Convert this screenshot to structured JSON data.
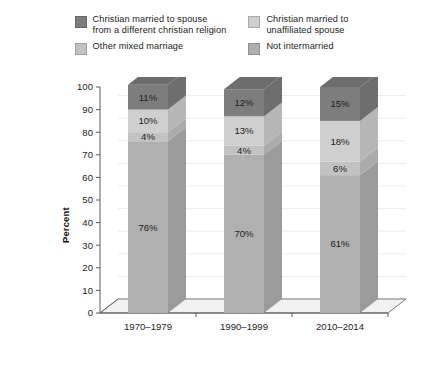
{
  "legend": {
    "items": [
      {
        "label": "Christian married to spouse\nfrom a different christian religion",
        "color": "#7d7d7d",
        "key": "diff_christian"
      },
      {
        "label": "Christian married to\nunaffiliated spouse",
        "color": "#cfcfcf",
        "key": "unaffiliated"
      },
      {
        "label": "Other mixed marriage",
        "color": "#c2c2c2",
        "key": "other_mixed"
      },
      {
        "label": "Not intermarried",
        "color": "#b0b0b0",
        "key": "not_intermarried"
      }
    ]
  },
  "axes": {
    "ylabel": "Percent",
    "yticks": [
      "100",
      "90",
      "80",
      "70",
      "60",
      "50",
      "40",
      "30",
      "20",
      "10",
      "0"
    ],
    "xticks": [
      "1970–1979",
      "1990–1999",
      "2010–2014"
    ]
  },
  "chart_data": {
    "type": "bar",
    "subtype": "stacked-column-3d",
    "title": "",
    "xlabel": "",
    "ylabel": "Percent",
    "ylim": [
      0,
      100
    ],
    "ytick_step": 10,
    "grid": true,
    "legend_position": "top",
    "categories": [
      "1970–1979",
      "1990–1999",
      "2010–2014"
    ],
    "stack_order_bottom_to_top": [
      "Not intermarried",
      "Other mixed marriage",
      "Christian married to unaffiliated spouse",
      "Christian married to spouse from a different christian religion"
    ],
    "series": [
      {
        "name": "Not intermarried",
        "color": "#b0b0b0",
        "values": [
          76,
          70,
          61
        ],
        "labels": [
          "76%",
          "70%",
          "61%"
        ]
      },
      {
        "name": "Other mixed marriage",
        "color": "#c2c2c2",
        "values": [
          4,
          4,
          6
        ],
        "labels": [
          "4%",
          "4%",
          "6%"
        ]
      },
      {
        "name": "Christian married to unaffiliated spouse",
        "color": "#cfcfcf",
        "values": [
          10,
          13,
          18
        ],
        "labels": [
          "10%",
          "13%",
          "18%"
        ]
      },
      {
        "name": "Christian married to spouse from a different christian religion",
        "color": "#7d7d7d",
        "values": [
          11,
          12,
          15
        ],
        "labels": [
          "11%",
          "12%",
          "15%"
        ]
      }
    ]
  },
  "style": {
    "axis_color": "#5a5a5a",
    "grid_color": "#ededed",
    "floor_color": "#f2f2f2",
    "text_color": "#1d1d1d",
    "top_face_shade": "#6d6d6d",
    "side_face_shade_factor": "0.88"
  }
}
